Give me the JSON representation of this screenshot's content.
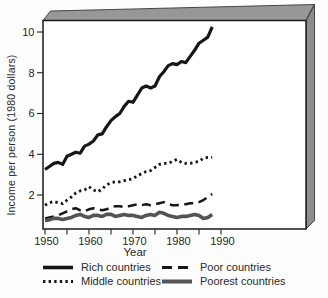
{
  "figure": {
    "background": "#fdfdfd",
    "face_color": "#ffffff",
    "border_color": "#1a1a1a",
    "top_band_color": "#979797",
    "side_band_color": "#8c8c8c",
    "text_color": "#1f1f1f"
  },
  "chart_data": {
    "type": "line",
    "title": "",
    "xlabel": "Year",
    "ylabel": "Income per person (1980 dollars)",
    "xlim": [
      1950,
      2009
    ],
    "ylim": [
      0.3,
      10.6
    ],
    "grid": false,
    "legend_position": "below",
    "xticks": [
      1950,
      1955,
      1960,
      1965,
      1970,
      1975,
      1980,
      1985,
      1990
    ],
    "xtick_labels": [
      1950,
      1960,
      1970,
      1980,
      1990
    ],
    "yticks": [
      2,
      4,
      6,
      8,
      10
    ],
    "series": [
      {
        "name": "Rich countries",
        "color": "#161616",
        "width": 3.2,
        "dash": "",
        "points": [
          [
            1950,
            3.25
          ],
          [
            1951,
            3.4
          ],
          [
            1952,
            3.55
          ],
          [
            1953,
            3.6
          ],
          [
            1954,
            3.5
          ],
          [
            1955,
            3.9
          ],
          [
            1956,
            4.0
          ],
          [
            1957,
            4.1
          ],
          [
            1958,
            4.05
          ],
          [
            1959,
            4.4
          ],
          [
            1960,
            4.5
          ],
          [
            1961,
            4.65
          ],
          [
            1962,
            4.95
          ],
          [
            1963,
            5.0
          ],
          [
            1964,
            5.35
          ],
          [
            1965,
            5.65
          ],
          [
            1966,
            5.85
          ],
          [
            1967,
            6.0
          ],
          [
            1968,
            6.35
          ],
          [
            1969,
            6.6
          ],
          [
            1970,
            6.55
          ],
          [
            1971,
            6.9
          ],
          [
            1972,
            7.25
          ],
          [
            1973,
            7.35
          ],
          [
            1974,
            7.25
          ],
          [
            1975,
            7.35
          ],
          [
            1976,
            7.8
          ],
          [
            1977,
            8.05
          ],
          [
            1978,
            8.35
          ],
          [
            1979,
            8.45
          ],
          [
            1980,
            8.4
          ],
          [
            1981,
            8.55
          ],
          [
            1982,
            8.5
          ],
          [
            1983,
            8.8
          ],
          [
            1984,
            9.1
          ],
          [
            1985,
            9.45
          ],
          [
            1986,
            9.6
          ],
          [
            1987,
            9.75
          ],
          [
            1988,
            10.25
          ]
        ]
      },
      {
        "name": "Middle countries",
        "color": "#161616",
        "width": 2.8,
        "dash": "2.4 3.2",
        "points": [
          [
            1950,
            1.5
          ],
          [
            1951,
            1.62
          ],
          [
            1952,
            1.68
          ],
          [
            1953,
            1.62
          ],
          [
            1954,
            1.58
          ],
          [
            1955,
            1.75
          ],
          [
            1956,
            1.9
          ],
          [
            1957,
            2.1
          ],
          [
            1958,
            2.2
          ],
          [
            1959,
            2.25
          ],
          [
            1960,
            2.4
          ],
          [
            1961,
            2.25
          ],
          [
            1962,
            2.15
          ],
          [
            1963,
            2.3
          ],
          [
            1964,
            2.5
          ],
          [
            1965,
            2.6
          ],
          [
            1966,
            2.65
          ],
          [
            1967,
            2.65
          ],
          [
            1968,
            2.7
          ],
          [
            1969,
            2.75
          ],
          [
            1970,
            2.8
          ],
          [
            1971,
            2.95
          ],
          [
            1972,
            3.05
          ],
          [
            1973,
            3.15
          ],
          [
            1974,
            3.2
          ],
          [
            1975,
            3.35
          ],
          [
            1976,
            3.5
          ],
          [
            1977,
            3.55
          ],
          [
            1978,
            3.55
          ],
          [
            1979,
            3.65
          ],
          [
            1980,
            3.75
          ],
          [
            1981,
            3.6
          ],
          [
            1982,
            3.55
          ],
          [
            1983,
            3.55
          ],
          [
            1984,
            3.6
          ],
          [
            1985,
            3.65
          ],
          [
            1986,
            3.8
          ],
          [
            1987,
            3.85
          ],
          [
            1988,
            3.85
          ]
        ]
      },
      {
        "name": "Poor countries",
        "color": "#161616",
        "width": 2.5,
        "dash": "9 5.5",
        "points": [
          [
            1950,
            0.85
          ],
          [
            1951,
            0.9
          ],
          [
            1952,
            0.95
          ],
          [
            1953,
            1.0
          ],
          [
            1954,
            1.1
          ],
          [
            1955,
            1.2
          ],
          [
            1956,
            1.3
          ],
          [
            1957,
            1.35
          ],
          [
            1958,
            1.25
          ],
          [
            1959,
            1.2
          ],
          [
            1960,
            1.3
          ],
          [
            1961,
            1.35
          ],
          [
            1962,
            1.3
          ],
          [
            1963,
            1.25
          ],
          [
            1964,
            1.3
          ],
          [
            1965,
            1.4
          ],
          [
            1966,
            1.45
          ],
          [
            1967,
            1.45
          ],
          [
            1968,
            1.4
          ],
          [
            1969,
            1.45
          ],
          [
            1970,
            1.5
          ],
          [
            1971,
            1.55
          ],
          [
            1972,
            1.5
          ],
          [
            1973,
            1.55
          ],
          [
            1974,
            1.5
          ],
          [
            1975,
            1.55
          ],
          [
            1976,
            1.6
          ],
          [
            1977,
            1.65
          ],
          [
            1978,
            1.55
          ],
          [
            1979,
            1.5
          ],
          [
            1980,
            1.5
          ],
          [
            1981,
            1.55
          ],
          [
            1982,
            1.55
          ],
          [
            1983,
            1.6
          ],
          [
            1984,
            1.6
          ],
          [
            1985,
            1.65
          ],
          [
            1986,
            1.75
          ],
          [
            1987,
            1.9
          ],
          [
            1988,
            2.05
          ]
        ]
      },
      {
        "name": "Poorest countries",
        "color": "#545454",
        "width": 3.6,
        "dash": "",
        "points": [
          [
            1950,
            0.75
          ],
          [
            1951,
            0.78
          ],
          [
            1952,
            0.85
          ],
          [
            1953,
            0.85
          ],
          [
            1954,
            0.8
          ],
          [
            1955,
            0.85
          ],
          [
            1956,
            0.9
          ],
          [
            1957,
            1.0
          ],
          [
            1958,
            1.05
          ],
          [
            1959,
            0.95
          ],
          [
            1960,
            0.9
          ],
          [
            1961,
            1.0
          ],
          [
            1962,
            1.0
          ],
          [
            1963,
            0.95
          ],
          [
            1964,
            1.05
          ],
          [
            1965,
            1.05
          ],
          [
            1966,
            0.95
          ],
          [
            1967,
            1.0
          ],
          [
            1968,
            1.05
          ],
          [
            1969,
            1.0
          ],
          [
            1970,
            1.0
          ],
          [
            1971,
            0.95
          ],
          [
            1972,
            0.9
          ],
          [
            1973,
            1.0
          ],
          [
            1974,
            1.05
          ],
          [
            1975,
            1.0
          ],
          [
            1976,
            1.15
          ],
          [
            1977,
            1.1
          ],
          [
            1978,
            1.0
          ],
          [
            1979,
            0.95
          ],
          [
            1980,
            0.9
          ],
          [
            1981,
            0.95
          ],
          [
            1982,
            0.95
          ],
          [
            1983,
            1.0
          ],
          [
            1984,
            1.05
          ],
          [
            1985,
            1.0
          ],
          [
            1986,
            0.85
          ],
          [
            1987,
            0.9
          ],
          [
            1988,
            1.05
          ]
        ]
      }
    ]
  }
}
